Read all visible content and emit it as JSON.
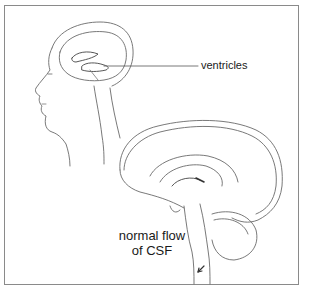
{
  "figure": {
    "labels": {
      "ventricles": "ventricles",
      "csf_line1": "normal flow",
      "csf_line2": "of CSF"
    },
    "colors": {
      "border": "#8a8a8a",
      "line": "#555555",
      "text": "#1a1a1a"
    }
  }
}
